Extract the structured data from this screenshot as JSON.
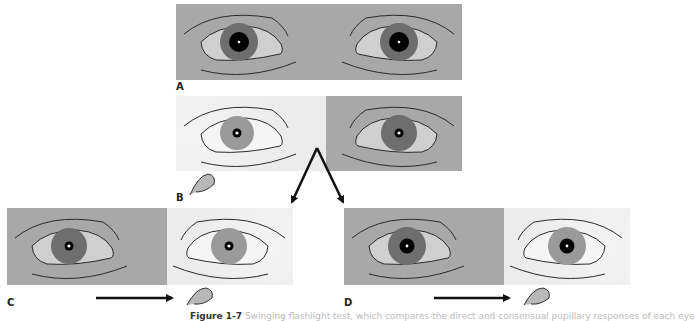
{
  "figure": {
    "panels": [
      {
        "id": "A",
        "label": "A",
        "left_eye": "dilated",
        "right_eye": "dilated",
        "lighting": "dim",
        "description": "Both pupils equal in dim light"
      },
      {
        "id": "B",
        "label": "B",
        "left_eye": "constricted",
        "right_eye": "constricted",
        "lighting": "light on left eye",
        "description": "Light shone in left eye"
      },
      {
        "id": "C",
        "label": "C",
        "left_eye": "constricted",
        "right_eye": "constricted",
        "lighting": "light moved to right eye",
        "description": "Light swung to right eye, normal response"
      },
      {
        "id": "D",
        "label": "D",
        "left_eye": "dilated",
        "right_eye": "dilated",
        "lighting": "light moved to right eye",
        "description": "Light swung to right eye, pupils dilate"
      }
    ],
    "caption_prefix": "Figure 1-7",
    "caption_rest": " Swinging flashlight test, which compares the direct and consensual pupillary responses of each eye"
  },
  "colors": {
    "background_dim": "#a8a8a8",
    "background_lit": "#ececec",
    "iris_dark": "#6e6e6e",
    "iris_light": "#9a9a9a",
    "pupil": "#000000",
    "sclera_dim": "#cfcfcf",
    "sclera_lit": "#f5f5f5",
    "line": "#2a2a2a"
  }
}
